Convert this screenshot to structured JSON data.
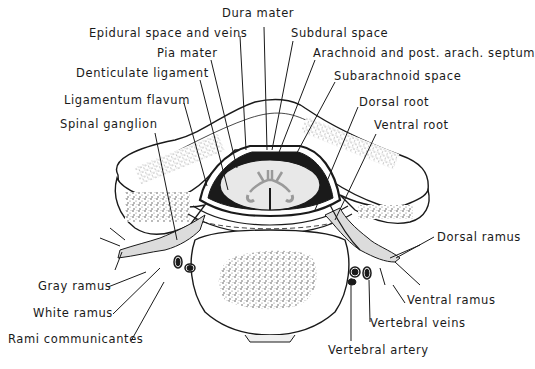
{
  "diagram": {
    "colors": {
      "ink": "#1a1a1a",
      "background": "#ffffff",
      "cord": "#e8e8e8",
      "nerve": "#dcdcdc",
      "bone_stipple": "#555555"
    },
    "labels": {
      "dura_mater": "Dura mater",
      "epidural_space": "Epidural space and veins",
      "subdural_space": "Subdural space",
      "pia_mater": "Pia mater",
      "arachnoid": "Arachnoid and post. arach. septum",
      "denticulate_ligament": "Denticulate ligament",
      "subarachnoid_space": "Subarachnoid space",
      "ligamentum_flavum": "Ligamentum flavum",
      "dorsal_root": "Dorsal root",
      "spinal_ganglion": "Spinal ganglion",
      "ventral_root": "Ventral root",
      "dorsal_ramus": "Dorsal ramus",
      "gray_ramus": "Gray ramus",
      "white_ramus": "White ramus",
      "ventral_ramus": "Ventral ramus",
      "vertebral_veins": "Vertebral veins",
      "rami_communicantes": "Rami communicantes",
      "vertebral_artery": "Vertebral artery"
    }
  }
}
